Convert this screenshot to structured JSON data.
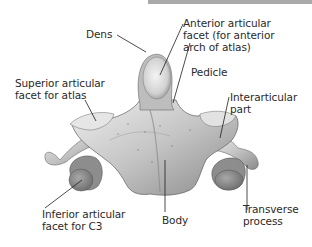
{
  "figure": {
    "colors": {
      "bone_light": "#e8e8e8",
      "bone_mid": "#bdbdbd",
      "bone_dark": "#6e6e6e",
      "leader": "#1e1e1e",
      "topbar": "#a9a9a9"
    }
  },
  "labels": {
    "dens": "Dens",
    "anterior_facet": "Anterior articular\nfacet (for anterior\narch of atlas)",
    "pedicle": "Pedicle",
    "superior_facet": "Superior articular\nfacet for atlas",
    "interarticular": "Interarticular\npart",
    "inferior_facet": "Inferior articular\nfacet for C3",
    "body": "Body",
    "transverse": "Transverse\nprocess"
  }
}
